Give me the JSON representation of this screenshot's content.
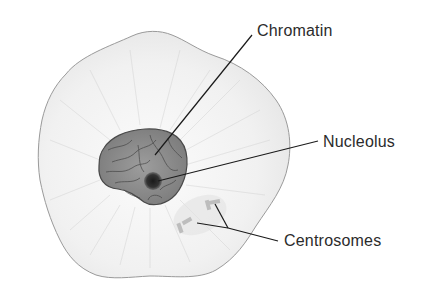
{
  "diagram": {
    "labels": [
      {
        "id": "chromatin",
        "text": "Chromatin",
        "x": 257,
        "y": 22
      },
      {
        "id": "nucleolus",
        "text": "Nucleolus",
        "x": 323,
        "y": 132
      },
      {
        "id": "centrosomes",
        "text": "Centrosomes",
        "x": 284,
        "y": 231
      }
    ],
    "colors": {
      "cell_fill": "#f3f3f3",
      "cell_outline": "#9a9a9a",
      "nucleus_fill": "#8c8c8c",
      "nucleus_outline": "#4a4a4a",
      "nucleolus_fill": "#2a2a2a",
      "leader_line": "#1a1a1a",
      "text": "#2b2b2b"
    }
  }
}
